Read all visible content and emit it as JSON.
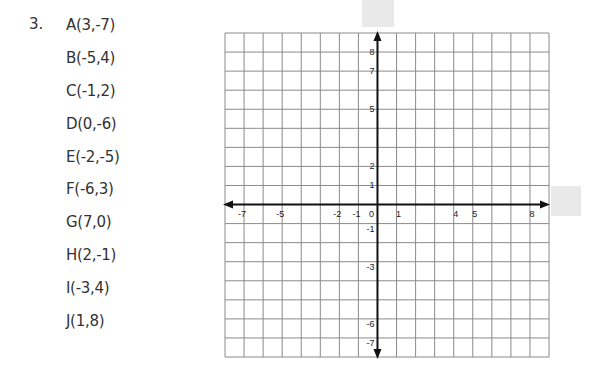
{
  "problem": {
    "number": "3.",
    "points": [
      {
        "label": "A(3,-7)",
        "name": "A",
        "x": 3,
        "y": -7
      },
      {
        "label": "B(-5,4)",
        "name": "B",
        "x": -5,
        "y": 4
      },
      {
        "label": "C(-1,2)",
        "name": "C",
        "x": -1,
        "y": 2
      },
      {
        "label": "D(0,-6)",
        "name": "D",
        "x": 0,
        "y": -6
      },
      {
        "label": "E(-2,-5)",
        "name": "E",
        "x": -2,
        "y": -5
      },
      {
        "label": "F(-6,3)",
        "name": "F",
        "x": -6,
        "y": 3
      },
      {
        "label": "G(7,0)",
        "name": "G",
        "x": 7,
        "y": 0
      },
      {
        "label": "H(2,-1)",
        "name": "H",
        "x": 2,
        "y": -1
      },
      {
        "label": "I(-3,4)",
        "name": "I",
        "x": -3,
        "y": 4
      },
      {
        "label": "J(1,8)",
        "name": "J",
        "x": 1,
        "y": 8
      }
    ]
  },
  "grid": {
    "x_range": [
      -8,
      9
    ],
    "y_range": [
      -8,
      9
    ],
    "x_tick_labels": [
      "-7",
      "-5",
      "-2",
      "-1",
      "0",
      "1",
      "4",
      "5",
      "8"
    ],
    "y_tick_labels": [
      "8",
      "7",
      "5",
      "2",
      "1",
      "-1",
      "-3",
      "-6",
      "-7"
    ]
  },
  "colors": {
    "grid_line": "#8a8a8a",
    "axis": "#111111",
    "placeholder_box": "#e9e9e9"
  }
}
